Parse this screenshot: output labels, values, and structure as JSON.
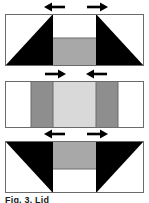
{
  "figure": {
    "caption": "Fig. 3. Lid",
    "background_color": "#ffffff",
    "border_color": "#6b6b6b",
    "black_color": "#000000",
    "dark_gray_color": "#8e8e8e",
    "light_gray_color": "#d9d9d9",
    "mid_gray_color": "#a8a8a8",
    "white_color": "#ffffff",
    "panels": [
      {
        "name": "panel-top",
        "arrow_left": {
          "name": "arrow-left",
          "direction": "left"
        },
        "arrow_right": {
          "name": "arrow-right",
          "direction": "right"
        },
        "description": "rectangle with black triangles at left and right, gray block at bottom center",
        "regions": [
          {
            "name": "left-triangle",
            "fill": "black"
          },
          {
            "name": "center-top-block",
            "fill": "white"
          },
          {
            "name": "center-bottom-block",
            "fill": "mid-gray"
          },
          {
            "name": "right-triangle",
            "fill": "black"
          }
        ]
      },
      {
        "name": "panel-middle",
        "arrow_left": {
          "name": "arrow-left",
          "direction": "right"
        },
        "arrow_right": {
          "name": "arrow-right",
          "direction": "left"
        },
        "description": "rectangle split into five vertical bands: white, dark gray, light gray, dark gray, white",
        "regions": [
          {
            "name": "band-outer-left",
            "fill": "white"
          },
          {
            "name": "band-inner-left",
            "fill": "dark-gray"
          },
          {
            "name": "band-center",
            "fill": "light-gray"
          },
          {
            "name": "band-inner-right",
            "fill": "dark-gray"
          },
          {
            "name": "band-outer-right",
            "fill": "white"
          }
        ]
      },
      {
        "name": "panel-bottom",
        "arrow_left": {
          "name": "arrow-left",
          "direction": "left"
        },
        "arrow_right": {
          "name": "arrow-right",
          "direction": "right"
        },
        "description": "rectangle with inverted black triangles at left and right, gray block at top center",
        "regions": [
          {
            "name": "left-triangle",
            "fill": "black"
          },
          {
            "name": "center-top-block",
            "fill": "mid-gray"
          },
          {
            "name": "center-bottom-block",
            "fill": "white"
          },
          {
            "name": "right-triangle",
            "fill": "black"
          }
        ]
      }
    ]
  }
}
